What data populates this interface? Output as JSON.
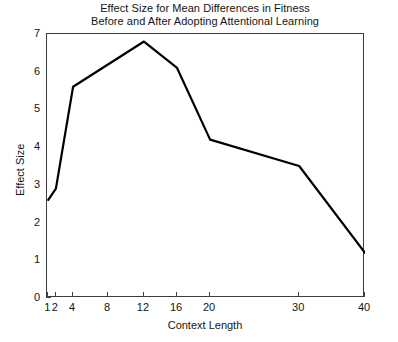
{
  "chart_data": {
    "type": "line",
    "title": "Effect Size for Mean Differences in Fitness",
    "subtitle": "Before and After Adopting Attentional Learning",
    "xlabel": "Context Length",
    "ylabel": "Effect Size",
    "x": [
      1,
      2,
      4,
      12,
      16,
      20,
      30,
      40
    ],
    "values": [
      2.6,
      2.9,
      5.6,
      6.8,
      6.1,
      4.2,
      3.5,
      1.2
    ],
    "series": [
      {
        "name": "Effect Size",
        "values": [
          2.6,
          2.9,
          5.6,
          6.8,
          6.1,
          4.2,
          3.5,
          1.2
        ],
        "color": "#000000"
      }
    ],
    "xticks": [
      1,
      2,
      4,
      8,
      12,
      16,
      20,
      30,
      40
    ],
    "xtick_labels": [
      "1",
      "2",
      "4",
      "8",
      "12",
      "16",
      "20",
      "30",
      "40"
    ],
    "yticks": [
      0,
      1,
      2,
      3,
      4,
      5,
      6,
      7
    ],
    "ytick_labels": [
      "0",
      "1",
      "2",
      "3",
      "4",
      "5",
      "6",
      "7"
    ],
    "ylim": [
      0,
      7
    ],
    "xlim": [
      1,
      40
    ],
    "x_scale": "categorical-spaced",
    "grid": false,
    "legend": "none",
    "line_color": "#000000",
    "line_width": 2,
    "markers": "none",
    "background": "#ffffff",
    "axis_color": "#3d3d3d"
  },
  "chart_title": {
    "line1": "Effect Size for Mean Differences in Fitness",
    "line2": "Before and After Adopting Attentional Learning"
  }
}
